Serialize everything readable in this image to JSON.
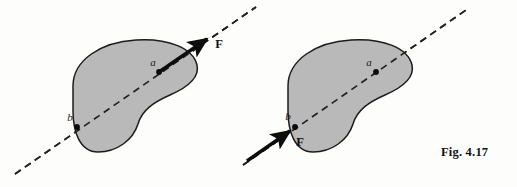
{
  "figure": {
    "caption": "Fig. 4.17",
    "caption_position": {
      "x": 441,
      "y": 152
    },
    "background_color": "#fdfdfc",
    "body_fill_color": "#b9b9b9",
    "body_stroke_color": "#1c1c1c",
    "line_of_action_color": "#222222",
    "force_color": "#0d0d0d"
  },
  "panels": [
    {
      "id": "left-panel",
      "name": "force-applied-at-a",
      "body": {
        "name": "rigid-body-blob",
        "path": "M 73 86 C 73 60, 101 42, 136 40 C 168 38, 193 48, 197 65 C 200 78, 186 88, 170 95 C 154 102, 142 110, 138 124 C 133 140, 117 152, 98 152 C 79 152, 73 130, 73 111 Z"
      },
      "line_of_action": {
        "name": "line-of-action",
        "x1": 15,
        "y1": 174,
        "x2": 256,
        "y2": 7,
        "dash": "7 5"
      },
      "points": [
        {
          "name": "point-a",
          "label": "a",
          "cx": 159,
          "cy": 72,
          "label_x": 153,
          "label_y": 66
        },
        {
          "name": "point-b",
          "label": "b",
          "cx": 77,
          "cy": 127,
          "label_x": 70,
          "label_y": 121
        }
      ],
      "force": {
        "name": "force-vector-F",
        "label": "F",
        "tail_x": 159,
        "tail_y": 72,
        "head_x": 212,
        "head_y": 35,
        "label_x": 219,
        "label_y": 48,
        "direction": "outward-up-right",
        "applied_at": "a"
      }
    },
    {
      "id": "right-panel",
      "name": "force-applied-at-b",
      "body": {
        "name": "rigid-body-blob",
        "path": "M 288 86 C 288 60, 316 42, 351 40 C 383 38, 408 48, 412 65 C 415 78, 401 88, 385 95 C 369 102, 357 110, 353 124 C 348 140, 332 152, 313 152 C 294 152, 288 130, 288 111 Z"
      },
      "line_of_action": {
        "name": "line-of-action",
        "x1": 243,
        "y1": 165,
        "x2": 466,
        "y2": 10,
        "dash": "7 5"
      },
      "points": [
        {
          "name": "point-a",
          "label": "a",
          "cx": 376,
          "cy": 72,
          "label_x": 369,
          "label_y": 66
        },
        {
          "name": "point-b",
          "label": "b",
          "cx": 295,
          "cy": 127,
          "label_x": 288,
          "label_y": 120
        }
      ],
      "force": {
        "name": "force-vector-F",
        "label": "F",
        "tail_x": 247,
        "tail_y": 161,
        "head_x": 295,
        "head_y": 127,
        "label_x": 300,
        "label_y": 146,
        "direction": "inward-up-right",
        "applied_at": "b"
      }
    }
  ]
}
